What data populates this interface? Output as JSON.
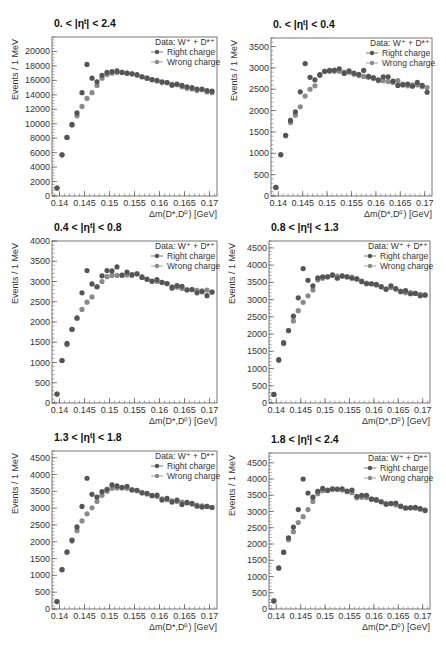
{
  "figure": {
    "legend": {
      "header": "Data: W⁺ + D*⁺",
      "series": [
        "Right charge",
        "Wrong charge"
      ]
    },
    "colors": {
      "right": "#555555",
      "wrong": "#8a8a8a",
      "frame": "#555555"
    }
  },
  "chart_data": [
    {
      "type": "scatter",
      "title": "0. < |ηᵗ| < 2.4",
      "xlabel": "Δm(D*,D⁰) [GeV]",
      "ylabel": "Events / 1 MeV",
      "xlim": [
        0.1385,
        0.1715
      ],
      "ylim": [
        0,
        22000
      ],
      "xticks": [
        0.14,
        0.145,
        0.15,
        0.155,
        0.16,
        0.165,
        0.17
      ],
      "yticks": [
        0,
        2000,
        4000,
        6000,
        8000,
        10000,
        12000,
        14000,
        16000,
        18000,
        20000
      ],
      "x": [
        0.1395,
        0.1405,
        0.1415,
        0.1425,
        0.1435,
        0.1445,
        0.1455,
        0.1465,
        0.1475,
        0.1485,
        0.1495,
        0.1505,
        0.1515,
        0.1525,
        0.1535,
        0.1545,
        0.1555,
        0.1565,
        0.1575,
        0.1585,
        0.1595,
        0.1605,
        0.1615,
        0.1625,
        0.1635,
        0.1645,
        0.1655,
        0.1665,
        0.1675,
        0.1685,
        0.1695,
        0.1705
      ],
      "series": [
        {
          "name": "Right charge",
          "values": [
            1100,
            5700,
            8100,
            9900,
            11500,
            14300,
            18200,
            16300,
            15800,
            16700,
            17100,
            17200,
            17300,
            17100,
            17000,
            16900,
            16800,
            16500,
            16300,
            16100,
            16000,
            15800,
            15700,
            15400,
            15500,
            15300,
            15100,
            15000,
            14800,
            14800,
            14600,
            14500
          ]
        },
        {
          "name": "Wrong charge",
          "values": [
            1100,
            5700,
            8100,
            9800,
            11100,
            12400,
            13500,
            14300,
            15300,
            16300,
            16800,
            17000,
            17100,
            17100,
            17000,
            16900,
            16700,
            16500,
            16300,
            16100,
            15900,
            15700,
            15700,
            15300,
            15400,
            15100,
            14900,
            14800,
            14600,
            14700,
            14400,
            14300
          ]
        }
      ]
    },
    {
      "type": "scatter",
      "title": "0. < |ηᵗ| < 0.4",
      "xlabel": "Δm(D*,D⁰) [GeV]",
      "ylabel": "Events / 1 MeV",
      "xlim": [
        0.1385,
        0.1715
      ],
      "ylim": [
        0,
        3700
      ],
      "xticks": [
        0.14,
        0.145,
        0.15,
        0.155,
        0.16,
        0.165,
        0.17
      ],
      "yticks": [
        0,
        500,
        1000,
        1500,
        2000,
        2500,
        3000,
        3500
      ],
      "x": [
        0.1395,
        0.1405,
        0.1415,
        0.1425,
        0.1435,
        0.1445,
        0.1455,
        0.1465,
        0.1475,
        0.1485,
        0.1495,
        0.1505,
        0.1515,
        0.1525,
        0.1535,
        0.1545,
        0.1555,
        0.1565,
        0.1575,
        0.1585,
        0.1595,
        0.1605,
        0.1615,
        0.1625,
        0.1635,
        0.1645,
        0.1655,
        0.1665,
        0.1675,
        0.1685,
        0.1695,
        0.1705
      ],
      "series": [
        {
          "name": "Right charge",
          "values": [
            200,
            970,
            1420,
            1770,
            1970,
            2440,
            3100,
            2780,
            2720,
            2840,
            2920,
            2940,
            2950,
            2980,
            2870,
            2930,
            2880,
            2850,
            2940,
            2800,
            2770,
            2720,
            2790,
            2790,
            2690,
            2590,
            2600,
            2620,
            2570,
            2660,
            2590,
            2430
          ]
        },
        {
          "name": "Wrong charge",
          "values": [
            200,
            960,
            1410,
            1720,
            1890,
            2090,
            2340,
            2500,
            2580,
            2820,
            2920,
            2920,
            2920,
            2920,
            2900,
            2900,
            2850,
            2820,
            2800,
            2780,
            2750,
            2700,
            2700,
            2680,
            2660,
            2700,
            2620,
            2580,
            2600,
            2600,
            2560,
            2540
          ]
        }
      ]
    },
    {
      "type": "scatter",
      "title": "0.4 < |ηᵗ| < 0.8",
      "xlabel": "Δm(D*,D⁰) [GeV]",
      "ylabel": "Events / 1 MeV",
      "xlim": [
        0.1385,
        0.1715
      ],
      "ylim": [
        0,
        4000
      ],
      "xticks": [
        0.14,
        0.145,
        0.15,
        0.155,
        0.16,
        0.165,
        0.17
      ],
      "yticks": [
        0,
        500,
        1000,
        1500,
        2000,
        2500,
        3000,
        3500,
        4000
      ],
      "x": [
        0.1395,
        0.1405,
        0.1415,
        0.1425,
        0.1435,
        0.1445,
        0.1455,
        0.1465,
        0.1475,
        0.1485,
        0.1495,
        0.1505,
        0.1515,
        0.1525,
        0.1535,
        0.1545,
        0.1555,
        0.1565,
        0.1575,
        0.1585,
        0.1595,
        0.1605,
        0.1615,
        0.1625,
        0.1635,
        0.1645,
        0.1655,
        0.1665,
        0.1675,
        0.1685,
        0.1695,
        0.1705
      ],
      "series": [
        {
          "name": "Right charge",
          "values": [
            220,
            1050,
            1470,
            1820,
            2100,
            2720,
            3270,
            2940,
            2870,
            3140,
            3270,
            3260,
            3360,
            3160,
            3230,
            3170,
            3190,
            3100,
            3060,
            3010,
            3050,
            2980,
            2950,
            2860,
            2900,
            2880,
            2790,
            2800,
            2720,
            2750,
            2650,
            2740
          ]
        },
        {
          "name": "Wrong charge",
          "values": [
            220,
            1050,
            1440,
            1820,
            2090,
            2310,
            2490,
            2620,
            2870,
            3000,
            3120,
            3150,
            3150,
            3150,
            3160,
            3150,
            3190,
            3120,
            3050,
            3000,
            3000,
            2980,
            2950,
            2830,
            2860,
            2830,
            2800,
            2800,
            2780,
            2770,
            2790,
            2740
          ]
        }
      ]
    },
    {
      "type": "scatter",
      "title": "0.8 < |ηᵗ| < 1.3",
      "xlabel": "Δm(D*,D⁰) [GeV]",
      "ylabel": "Events / 1 MeV",
      "xlim": [
        0.1385,
        0.1715
      ],
      "ylim": [
        0,
        4700
      ],
      "xticks": [
        0.14,
        0.145,
        0.15,
        0.155,
        0.16,
        0.165,
        0.17
      ],
      "yticks": [
        0,
        500,
        1000,
        1500,
        2000,
        2500,
        3000,
        3500,
        4000,
        4500
      ],
      "x": [
        0.1395,
        0.1405,
        0.1415,
        0.1425,
        0.1435,
        0.1445,
        0.1455,
        0.1465,
        0.1475,
        0.1485,
        0.1495,
        0.1505,
        0.1515,
        0.1525,
        0.1535,
        0.1545,
        0.1555,
        0.1565,
        0.1575,
        0.1585,
        0.1595,
        0.1605,
        0.1615,
        0.1625,
        0.1635,
        0.1645,
        0.1655,
        0.1665,
        0.1675,
        0.1685,
        0.1695,
        0.1705
      ],
      "series": [
        {
          "name": "Right charge",
          "values": [
            250,
            1260,
            1750,
            2100,
            2520,
            3050,
            3900,
            3560,
            3400,
            3630,
            3660,
            3660,
            3720,
            3620,
            3690,
            3660,
            3620,
            3600,
            3520,
            3460,
            3460,
            3440,
            3370,
            3300,
            3400,
            3320,
            3230,
            3260,
            3170,
            3180,
            3110,
            3140
          ]
        },
        {
          "name": "Wrong charge",
          "values": [
            250,
            1230,
            1720,
            2100,
            2380,
            2680,
            2920,
            3110,
            3280,
            3570,
            3620,
            3660,
            3700,
            3680,
            3680,
            3660,
            3650,
            3600,
            3540,
            3480,
            3460,
            3420,
            3380,
            3310,
            3350,
            3300,
            3250,
            3200,
            3200,
            3180,
            3150,
            3120
          ]
        }
      ]
    },
    {
      "type": "scatter",
      "title": "1.3 < |ηᵗ| < 1.8",
      "xlabel": "Δm(D*,D⁰) [GeV]",
      "ylabel": "Events / 1 MeV",
      "xlim": [
        0.1385,
        0.1715
      ],
      "ylim": [
        0,
        4700
      ],
      "xticks": [
        0.14,
        0.145,
        0.15,
        0.155,
        0.16,
        0.165,
        0.17
      ],
      "yticks": [
        0,
        500,
        1000,
        1500,
        2000,
        2500,
        3000,
        3500,
        4000,
        4500
      ],
      "x": [
        0.1395,
        0.1405,
        0.1415,
        0.1425,
        0.1435,
        0.1445,
        0.1455,
        0.1465,
        0.1475,
        0.1485,
        0.1495,
        0.1505,
        0.1515,
        0.1525,
        0.1535,
        0.1545,
        0.1555,
        0.1565,
        0.1575,
        0.1585,
        0.1595,
        0.1605,
        0.1615,
        0.1625,
        0.1635,
        0.1645,
        0.1655,
        0.1665,
        0.1675,
        0.1685,
        0.1695,
        0.1705
      ],
      "series": [
        {
          "name": "Right charge",
          "values": [
            220,
            1170,
            1700,
            2050,
            2440,
            3050,
            3890,
            3410,
            3330,
            3490,
            3560,
            3690,
            3660,
            3620,
            3650,
            3540,
            3530,
            3450,
            3440,
            3370,
            3390,
            3240,
            3290,
            3180,
            3240,
            3110,
            3170,
            3140,
            3060,
            3030,
            3050,
            3020
          ]
        },
        {
          "name": "Wrong charge",
          "values": [
            220,
            1170,
            1680,
            2020,
            2330,
            2620,
            2830,
            3010,
            3200,
            3380,
            3500,
            3590,
            3600,
            3600,
            3590,
            3550,
            3520,
            3470,
            3420,
            3380,
            3350,
            3280,
            3250,
            3220,
            3200,
            3180,
            3150,
            3120,
            3090,
            3070,
            3050,
            3020
          ]
        }
      ]
    },
    {
      "type": "scatter",
      "title": "1.8 < |ηᵗ| < 2.4",
      "xlabel": "Δm(D*,D⁰) [GeV]",
      "ylabel": "Events / 1 MeV",
      "xlim": [
        0.1385,
        0.1715
      ],
      "ylim": [
        0,
        4800
      ],
      "xticks": [
        0.14,
        0.145,
        0.15,
        0.155,
        0.16,
        0.165,
        0.17
      ],
      "yticks": [
        0,
        500,
        1000,
        1500,
        2000,
        2500,
        3000,
        3500,
        4000,
        4500
      ],
      "x": [
        0.1395,
        0.1405,
        0.1415,
        0.1425,
        0.1435,
        0.1445,
        0.1455,
        0.1465,
        0.1475,
        0.1485,
        0.1495,
        0.1505,
        0.1515,
        0.1525,
        0.1535,
        0.1545,
        0.1555,
        0.1565,
        0.1575,
        0.1585,
        0.1595,
        0.1605,
        0.1615,
        0.1625,
        0.1635,
        0.1645,
        0.1655,
        0.1665,
        0.1675,
        0.1685,
        0.1695,
        0.1705
      ],
      "series": [
        {
          "name": "Right charge",
          "values": [
            250,
            1270,
            1750,
            2190,
            2520,
            3060,
            4000,
            3570,
            3440,
            3620,
            3710,
            3650,
            3700,
            3690,
            3700,
            3630,
            3660,
            3470,
            3500,
            3500,
            3380,
            3370,
            3300,
            3220,
            3240,
            3260,
            3170,
            3110,
            3110,
            3130,
            3090,
            3030
          ]
        },
        {
          "name": "Wrong charge",
          "values": [
            250,
            1250,
            1740,
            2130,
            2380,
            2660,
            2840,
            3060,
            3310,
            3550,
            3640,
            3660,
            3680,
            3680,
            3660,
            3610,
            3580,
            3420,
            3440,
            3430,
            3380,
            3340,
            3300,
            3250,
            3250,
            3200,
            3150,
            3100,
            3120,
            3100,
            3070,
            3050
          ]
        }
      ]
    }
  ]
}
